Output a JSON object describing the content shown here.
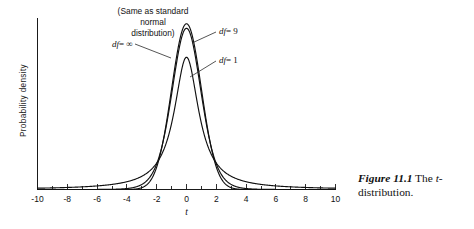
{
  "chart_data": {
    "type": "line",
    "title": "",
    "xlabel": "t",
    "ylabel": "Probability  density",
    "xlim": [
      -10,
      10
    ],
    "ylim": [
      0,
      0.42
    ],
    "grid": false,
    "legend_position": "inline-annotations",
    "x_ticks_major": [
      -10,
      -8,
      -6,
      -4,
      -2,
      0,
      2,
      4,
      6,
      8,
      10
    ],
    "x_ticks_minor_step": 1,
    "x_tick_labels": [
      "-10",
      "-8",
      "-6",
      "-4",
      "-2",
      "0",
      "2",
      "4",
      "6",
      "8",
      "10"
    ],
    "y_ticks": [],
    "series": [
      {
        "name": "df = ∞",
        "df": "infinity",
        "note": "Same as standard normal distribution",
        "peak_value": 0.3989
      },
      {
        "name": "df = 9",
        "df": 9,
        "peak_value": 0.3862
      },
      {
        "name": "df = 1",
        "df": 1,
        "peak_value": 0.3183
      }
    ]
  },
  "annotations": {
    "normal_note_line1": "(Same as standard",
    "normal_note_line2": "normal",
    "normal_note_line3": "distribution)",
    "label_df_inf_prefix": "df",
    "label_df_inf_value": "= ∞",
    "label_df_9_prefix": "df",
    "label_df_9_value": "= 9",
    "label_df_1_prefix": "df",
    "label_df_1_value": "= 1"
  },
  "axis": {
    "x_title": "t",
    "y_title": "Probability  density"
  },
  "caption": {
    "figure_number": "Figure 11.1",
    "text_part1": "The ",
    "italic_t": "t",
    "text_part2": "-distribution."
  },
  "colors": {
    "background": "#ffffff",
    "curve": "#111111",
    "axis": "#1a1a1a",
    "text": "#111111"
  }
}
